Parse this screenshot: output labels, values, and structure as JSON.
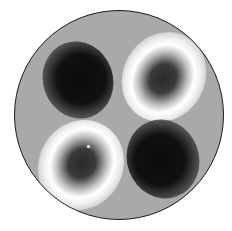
{
  "image": {
    "description": "Grayscale circular intensity pattern with four lobes (two dark, two bright rings with dark centers)",
    "colors": {
      "background": "#ffffff",
      "disc": "#a9a9a9",
      "border": "#1a1a1a",
      "dark": "#0a0a0a",
      "bright": "#ffffff"
    }
  }
}
